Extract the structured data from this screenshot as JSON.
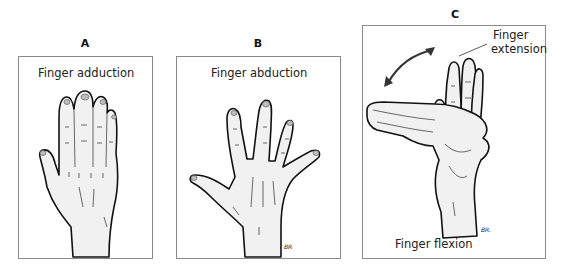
{
  "figure": {
    "panels": [
      {
        "letter": "A",
        "caption": "Finger adduction",
        "signature": ""
      },
      {
        "letter": "B",
        "caption": "Finger abduction",
        "signature": "BR"
      },
      {
        "letter": "C",
        "caption": "Finger flexion",
        "annotation": "Finger\nextension",
        "annotation_line1": "Finger",
        "annotation_line2": "extension",
        "signature": "BR."
      }
    ]
  }
}
